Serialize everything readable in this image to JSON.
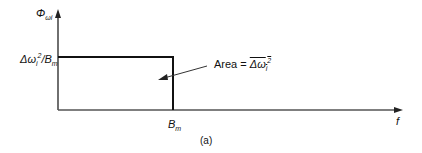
{
  "diagram": {
    "y_axis_label": {
      "main": "Φ",
      "sub": "ωi"
    },
    "x_axis_label": "f",
    "y_level_label": {
      "prefix": "Δω",
      "sub": "i",
      "sup": "2",
      "slash": "/",
      "B": "B",
      "B_sub": "m"
    },
    "x_mark_label": {
      "B": "B",
      "sub": "m"
    },
    "annotation": {
      "text": "Area = ",
      "overline": "Δω",
      "sub": "i",
      "sup": "2"
    },
    "caption": "(a)"
  }
}
